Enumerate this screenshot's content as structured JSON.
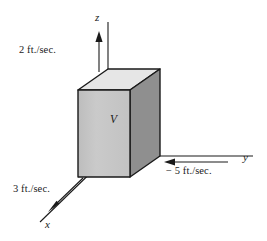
{
  "figure": {
    "axes": {
      "z": {
        "name": "z",
        "label": "z"
      },
      "y": {
        "name": "y",
        "label": "y"
      },
      "x": {
        "name": "x",
        "label": "x"
      }
    },
    "body": {
      "label": "V",
      "name": "control-volume"
    },
    "velocities": [
      {
        "axis": "z",
        "label": "2 ft./sec.",
        "value": 2,
        "units": "ft./sec.",
        "direction": "up"
      },
      {
        "axis": "y",
        "label": "− 5 ft./sec.",
        "value": -5,
        "units": "ft./sec.",
        "direction": "left"
      },
      {
        "axis": "x",
        "label": "3 ft./sec.",
        "value": 3,
        "units": "ft./sec.",
        "direction": "down-left"
      }
    ],
    "colors": {
      "front_face": "#c6c6c6",
      "right_face": "#8f8f8f",
      "top_face": "#e6e6e6",
      "outline": "#1a1a1a",
      "background": "#ffffff"
    }
  }
}
